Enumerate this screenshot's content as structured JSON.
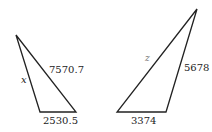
{
  "triangles": [
    {
      "name": "left",
      "labels": {
        "side_left": "x",
        "side_hyp": "7570.7",
        "side_base": "2530.5"
      }
    },
    {
      "name": "right",
      "labels": {
        "side_left": "z",
        "side_right": "5678",
        "side_base": "3374"
      }
    }
  ]
}
